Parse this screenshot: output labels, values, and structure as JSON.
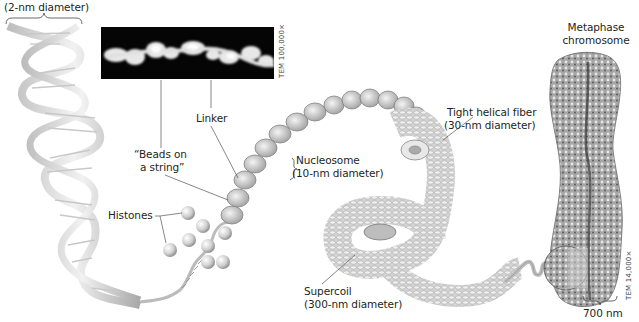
{
  "figure": {
    "labels": {
      "dna_diameter": "(2-nm diameter)",
      "beads_line1": "“Beads on",
      "beads_line2": "a string”",
      "linker": "Linker",
      "nucleosome_line1": "Nucleosome",
      "nucleosome_line2": "(10-nm diameter)",
      "histones": "Histones",
      "fiber_line1": "Tight helical fiber",
      "fiber_line2": "(30-nm diameter)",
      "supercoil_line1": "Supercoil",
      "supercoil_line2": "(300-nm diameter)",
      "chromosome_line1": "Metaphase",
      "chromosome_line2": "chromosome",
      "chromosome_width": "700 nm"
    },
    "micrograph_labels": {
      "beads_tem": "TEM 100,000×",
      "chromosome_tem": "TEM 14,000×"
    },
    "colors": {
      "text": "#231f20",
      "leader_line": "#555555",
      "dna_ribbon": "#d9d9d9",
      "dna_shadow": "#9a9a9a",
      "tem_background": "#050505",
      "histone": "#cfcfcf",
      "chromosome": "#8c8c8c"
    }
  }
}
